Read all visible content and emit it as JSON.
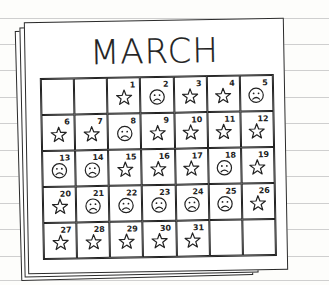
{
  "calendar": {
    "month": "MARCH",
    "leading_blank_cells": 2,
    "trailing_blank_cells": 2,
    "days": [
      {
        "day": "1",
        "mark": "star"
      },
      {
        "day": "2",
        "mark": "frown"
      },
      {
        "day": "3",
        "mark": "star"
      },
      {
        "day": "4",
        "mark": "star"
      },
      {
        "day": "5",
        "mark": "frown"
      },
      {
        "day": "6",
        "mark": "star"
      },
      {
        "day": "7",
        "mark": "star"
      },
      {
        "day": "8",
        "mark": "frown"
      },
      {
        "day": "9",
        "mark": "star"
      },
      {
        "day": "10",
        "mark": "star"
      },
      {
        "day": "11",
        "mark": "star"
      },
      {
        "day": "12",
        "mark": "star"
      },
      {
        "day": "13",
        "mark": "frown"
      },
      {
        "day": "14",
        "mark": "frown"
      },
      {
        "day": "15",
        "mark": "star"
      },
      {
        "day": "16",
        "mark": "star"
      },
      {
        "day": "17",
        "mark": "star"
      },
      {
        "day": "18",
        "mark": "frown"
      },
      {
        "day": "19",
        "mark": "star"
      },
      {
        "day": "20",
        "mark": "star"
      },
      {
        "day": "21",
        "mark": "frown"
      },
      {
        "day": "22",
        "mark": "frown"
      },
      {
        "day": "23",
        "mark": "frown"
      },
      {
        "day": "24",
        "mark": "frown"
      },
      {
        "day": "25",
        "mark": "frown"
      },
      {
        "day": "26",
        "mark": "star"
      },
      {
        "day": "27",
        "mark": "star"
      },
      {
        "day": "28",
        "mark": "star"
      },
      {
        "day": "29",
        "mark": "star"
      },
      {
        "day": "30",
        "mark": "star"
      },
      {
        "day": "31",
        "mark": "star"
      }
    ],
    "icons": {
      "star": "star-icon",
      "frown": "frown-face-icon"
    }
  },
  "colors": {
    "ink": "#222222",
    "paper": "#ffffff",
    "rule": "#cfcfcf"
  }
}
